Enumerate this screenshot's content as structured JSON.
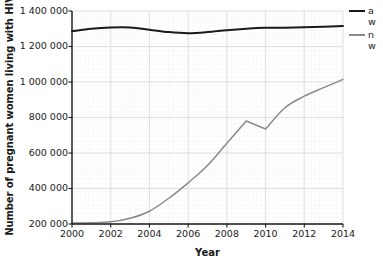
{
  "chart_data": {
    "type": "line",
    "title": "",
    "xlabel": "Year",
    "ylabel": "Number of pregnant women living with HIV",
    "x": [
      2000,
      2001,
      2002,
      2003,
      2004,
      2005,
      2006,
      2007,
      2008,
      2009,
      2010,
      2011,
      2012,
      2013,
      2014
    ],
    "xlim": [
      2000,
      2014
    ],
    "ylim": [
      200000,
      1400000
    ],
    "xticks": [
      "2000",
      "2002",
      "2004",
      "2006",
      "2008",
      "2010",
      "2012",
      "2014"
    ],
    "xtick_values": [
      2000,
      2002,
      2004,
      2006,
      2008,
      2010,
      2012,
      2014
    ],
    "yticks": [
      "200 000",
      "400 000",
      "600 000",
      "800 000",
      "1 000 000",
      "1 200 000",
      "1 400 000"
    ],
    "ytick_values": [
      200000,
      400000,
      600000,
      800000,
      1000000,
      1200000,
      1400000
    ],
    "grid": true,
    "legend_position": "right",
    "series": [
      {
        "name": "all pregnant women living with HIV",
        "legend_label": "a w",
        "color": "#1a1a1a",
        "width": 2.0,
        "values": [
          1286000,
          1300000,
          1307000,
          1307000,
          1295000,
          1281000,
          1275000,
          1281000,
          1292000,
          1300000,
          1305000,
          1306000,
          1308000,
          1311000,
          1315000
        ]
      },
      {
        "name": "number of pregnant women receiving antiretrovirals",
        "legend_label": "n w",
        "color": "#8a8a8a",
        "width": 1.5,
        "values": [
          205000,
          207000,
          212000,
          232000,
          272000,
          345000,
          432000,
          530000,
          655000,
          780000,
          735000,
          855000,
          920000,
          968000,
          1015000
        ]
      }
    ]
  },
  "legend": {
    "entries": [
      {
        "label": "a\nw"
      },
      {
        "label": "n\nw"
      }
    ]
  },
  "axes": {
    "x_title": "Year",
    "y_title": "Number of pregnant women living with HIV"
  }
}
